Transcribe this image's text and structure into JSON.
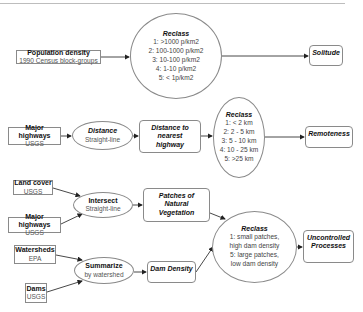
{
  "diagram": {
    "row1": {
      "input": {
        "title": "Population density",
        "subtitle": "1990 Census block-groups"
      },
      "reclass": {
        "title": "Reclass",
        "lines": [
          "1:  >1000 p/km2",
          "2:  100-1000 p/km2",
          "3:  10-100 p/km2",
          "4:  1-10 p/km2",
          "5:  < 1p/km2"
        ]
      },
      "output": {
        "title": "Solitude"
      }
    },
    "row2": {
      "input": {
        "title": "Major highways",
        "subtitle": "USGS"
      },
      "process": {
        "title": "Distance",
        "subtitle": "Straight-line"
      },
      "intermediate": {
        "title": "Distance to nearest highway"
      },
      "reclass": {
        "title": "Reclass",
        "lines": [
          "1:  < 2 km",
          "2:  2 - 5 km",
          "3:  5 - 10 km",
          "4:  10 - 25 km",
          "5:  >25 km"
        ]
      },
      "output": {
        "title": "Remoteness"
      }
    },
    "row3": {
      "input_a": {
        "title": "Land cover",
        "subtitle": "USGS"
      },
      "input_b": {
        "title": "Major highways",
        "subtitle": "USGS"
      },
      "process": {
        "title": "Intersect",
        "subtitle": "Straight-line"
      },
      "intermediate": {
        "title": "Patches of Natural Vegetation"
      },
      "input_c": {
        "title": "Watersheds",
        "subtitle": "EPA"
      },
      "input_d": {
        "title": "Dams",
        "subtitle": "USGS"
      },
      "process2": {
        "title": "Summarize",
        "subtitle": "by watershed"
      },
      "intermediate2": {
        "title": "Dam Density"
      },
      "reclass": {
        "title": "Reclass",
        "lines": [
          "1:  small patches,",
          "high dam density",
          "5:  large patches,",
          "low dam density"
        ]
      },
      "output": {
        "title": "Uncontrolled Processes"
      }
    },
    "colors": {
      "stroke": "#8a8a8a",
      "arrow": "#222222",
      "text": "#111111",
      "subtext": "#555555"
    }
  }
}
